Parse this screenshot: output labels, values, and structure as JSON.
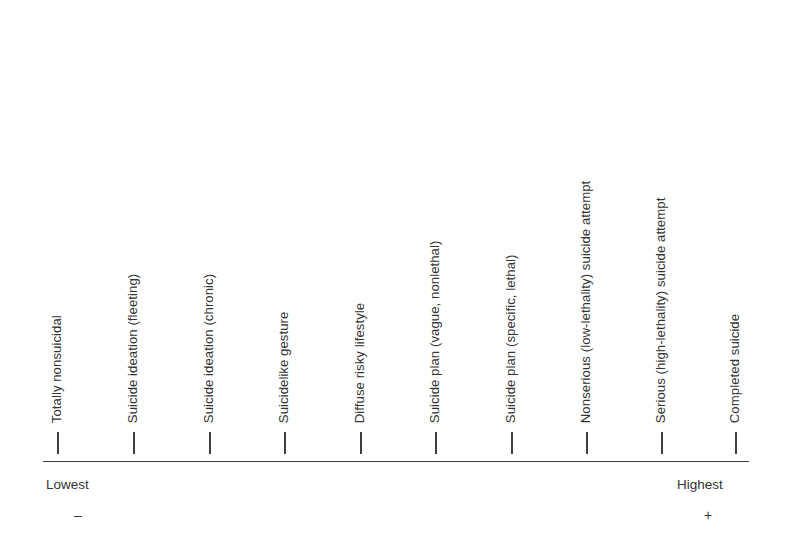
{
  "figure": {
    "background_color": "#ffffff",
    "text_color": "#333333",
    "axis_color": "#3a3a3a"
  },
  "chart_data": {
    "type": "bar",
    "title": "",
    "subtitle": "",
    "xlabel": "",
    "ylabel": "",
    "orientation": "horizontal",
    "grid": false,
    "legend": null,
    "axis": {
      "low_anchor_label": "Lowest",
      "low_anchor_sign": "–",
      "high_anchor_label": "Highest",
      "high_anchor_sign": "+",
      "tick_count": 10
    },
    "categories": [
      "Totally nonsuicidal",
      "Suicide ideation (fleeting)",
      "Suicide ideation (chronic)",
      "Suicidelike gesture",
      "Diffuse risky lifestyle",
      "Suicide plan (vague, nonlethal)",
      "Suicide plan (specific, lethal)",
      "Nonserious (low-lethality) suicide attempt",
      "Serious (high-lethality) suicide attempt",
      "Completed suicide"
    ],
    "values": [
      1,
      2,
      3,
      4,
      5,
      6,
      7,
      8,
      9,
      10
    ],
    "xlim": [
      1,
      10
    ],
    "annotations": []
  },
  "ticks": [
    {
      "index": 1,
      "label": "Totally nonsuicidal",
      "x": 58
    },
    {
      "index": 2,
      "label": "Suicide ideation (fleeting)",
      "x": 134
    },
    {
      "index": 3,
      "label": "Suicide ideation (chronic)",
      "x": 210
    },
    {
      "index": 4,
      "label": "Suicidelike gesture",
      "x": 285
    },
    {
      "index": 5,
      "label": "Diffuse risky lifestyle",
      "x": 361
    },
    {
      "index": 6,
      "label": "Suicide plan (vague, nonlethal)",
      "x": 436
    },
    {
      "index": 7,
      "label": "Suicide plan (specific, lethal)",
      "x": 512
    },
    {
      "index": 8,
      "label": "Nonserious (low-lethality) suicide attempt",
      "x": 587
    },
    {
      "index": 9,
      "label": "Serious (high-lethality) suicide attempt",
      "x": 662
    },
    {
      "index": 10,
      "label": "Completed suicide",
      "x": 736
    }
  ]
}
